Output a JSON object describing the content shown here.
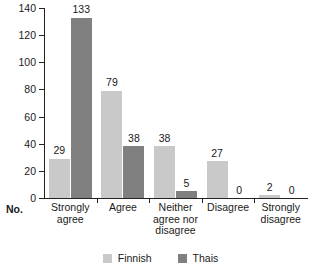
{
  "chart_data": {
    "type": "bar",
    "title": "",
    "subtitle": "",
    "xlabel": "",
    "ylabel": "No.",
    "ylim": [
      0,
      140
    ],
    "yticks": [
      0,
      20,
      40,
      60,
      80,
      100,
      120,
      140
    ],
    "grid": false,
    "legend_position": "bottom-center",
    "categories": [
      "Strongly agree",
      "Agree",
      "Neither agree nor disagree",
      "Disagree",
      "Strongly disagree"
    ],
    "category_lines": [
      [
        "Strongly",
        "agree"
      ],
      [
        "Agree"
      ],
      [
        "Neither",
        "agree nor",
        "disagree"
      ],
      [
        "Disagree"
      ],
      [
        "Strongly",
        "disagree"
      ]
    ],
    "series": [
      {
        "name": "Finnish",
        "color": "#c9c9c9",
        "values": [
          29,
          79,
          38,
          27,
          2
        ],
        "labels": [
          "29",
          "79",
          "38",
          "27",
          "2"
        ]
      },
      {
        "name": "Thais",
        "color": "#808080",
        "values": [
          133,
          38,
          5,
          0,
          0
        ],
        "labels": [
          "133",
          "38",
          "5",
          "0",
          "0"
        ]
      }
    ]
  },
  "axis": {
    "unit_label": "No.",
    "tick_labels": [
      "140",
      "120",
      "100",
      "80",
      "60",
      "40",
      "20",
      "0"
    ]
  },
  "legend": {
    "items": [
      {
        "label": "Finnish",
        "color": "#c9c9c9",
        "swatch": "square-swatch-light"
      },
      {
        "label": "Thais",
        "color": "#808080",
        "swatch": "square-swatch-dark"
      }
    ]
  },
  "colors": {
    "finnish": "#c9c9c9",
    "thais": "#808080",
    "axis": "#222222",
    "text": "#1a1a1a",
    "background": "#ffffff"
  }
}
